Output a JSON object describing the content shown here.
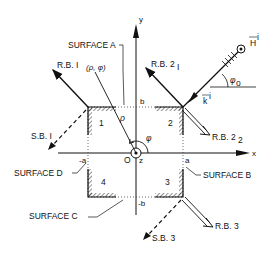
{
  "diagram": {
    "axes": {
      "x_label": "x",
      "y_label": "y",
      "z_label": "z",
      "origin_label": "O"
    },
    "bounds": {
      "a": "a",
      "neg_a": "-a",
      "b": "b",
      "neg_b": "-b"
    },
    "surfaces": {
      "A": "SURFACE  A",
      "B": "SURFACE  B",
      "C": "SURFACE  C",
      "D": "SURFACE  D"
    },
    "quadrants": [
      "1",
      "2",
      "3",
      "4"
    ],
    "beams": {
      "rb1": "R.B. I",
      "rb2_1": "R.B. 2",
      "rb2_1_sub": "I",
      "rb2_2": "R.B. 2",
      "rb2_2_sub": "2",
      "rb3": "R.B. 3",
      "sb1": "S.B. I",
      "sb3": "S.B. 3"
    },
    "incident": {
      "field": "H",
      "field_sup": "i",
      "wave_vector": "k",
      "wave_vector_sup": "i",
      "angle": "φ",
      "angle_sub": "o"
    },
    "point": {
      "coords": "(ρ, φ)",
      "rho": "ρ",
      "phi": "φ"
    }
  }
}
